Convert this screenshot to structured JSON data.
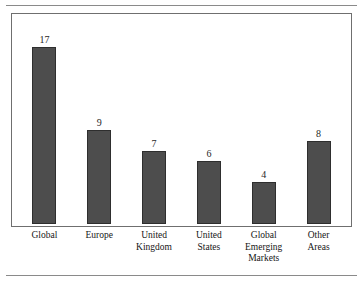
{
  "page": {
    "caption_remnant": "",
    "rules": [
      "top-rule",
      "bottom-rule"
    ]
  },
  "chart_data": {
    "type": "bar",
    "title": "",
    "xlabel": "",
    "ylabel": "",
    "ylim": [
      0,
      19
    ],
    "grid": false,
    "legend": false,
    "bar_color": "#4d4d4d",
    "bar_border_color": "#2e2e2e",
    "frame_color": "#6f6f6f",
    "categories": [
      "Global",
      "Europe",
      "United Kingdom",
      "United States",
      "Global Emerging Markets",
      "Other Areas"
    ],
    "category_lines": [
      [
        "Global"
      ],
      [
        "Europe"
      ],
      [
        "United",
        "Kingdom"
      ],
      [
        "United",
        "States"
      ],
      [
        "Global",
        "Emerging",
        "Markets"
      ],
      [
        "Other",
        "Areas"
      ]
    ],
    "values": [
      17,
      9,
      7,
      6,
      4,
      8
    ],
    "value_labels": [
      "17",
      "9",
      "7",
      "6",
      "4",
      "8"
    ]
  }
}
